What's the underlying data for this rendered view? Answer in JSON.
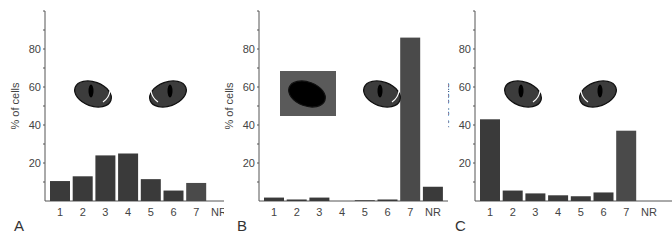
{
  "figure": {
    "panels": [
      {
        "letter": "A",
        "ylabel": "% of cells",
        "stimulus": "both-eyes-open"
      },
      {
        "letter": "B",
        "ylabel": "% of cells",
        "stimulus": "left-eye-occluded"
      },
      {
        "letter": "C",
        "ylabel": "% of cells",
        "stimulus": "both-eyes-open"
      }
    ],
    "yticks": [
      "20",
      "40",
      "60",
      "80"
    ],
    "categories": [
      "1",
      "2",
      "3",
      "4",
      "5",
      "6",
      "7",
      "NR"
    ]
  },
  "chart_data": [
    {
      "type": "bar",
      "panel": "A",
      "title": "",
      "xlabel": "",
      "ylabel": "% of cells",
      "categories": [
        "1",
        "2",
        "3",
        "4",
        "5",
        "6",
        "7",
        "NR"
      ],
      "values": [
        10.5,
        13,
        24,
        25,
        11.5,
        5.5,
        9.5,
        0
      ],
      "ylim": [
        0,
        100
      ],
      "yticks": [
        20,
        40,
        60,
        80
      ],
      "grid": false,
      "legend": "none",
      "annotations": [
        "two open cat eyes pictogram"
      ]
    },
    {
      "type": "bar",
      "panel": "B",
      "title": "",
      "xlabel": "",
      "ylabel": "% of cells",
      "categories": [
        "1",
        "2",
        "3",
        "4",
        "5",
        "6",
        "7",
        "NR"
      ],
      "values": [
        1.8,
        0.8,
        1.8,
        0,
        0.4,
        0.8,
        86,
        7.5
      ],
      "ylim": [
        0,
        100
      ],
      "yticks": [
        20,
        40,
        60,
        80
      ],
      "grid": false,
      "legend": "none",
      "annotations": [
        "left eye occluded (gray square patch), right eye open"
      ]
    },
    {
      "type": "bar",
      "panel": "C",
      "title": "",
      "xlabel": "",
      "ylabel": "% of cells",
      "categories": [
        "1",
        "2",
        "3",
        "4",
        "5",
        "6",
        "7",
        "NR"
      ],
      "values": [
        43,
        5.5,
        4,
        3,
        2.5,
        4.5,
        37,
        0
      ],
      "ylim": [
        0,
        100
      ],
      "yticks": [
        20,
        40,
        60,
        80
      ],
      "grid": false,
      "legend": "none",
      "annotations": [
        "two open cat eyes pictogram"
      ]
    }
  ],
  "colors": {
    "bar": "#3a3a3a",
    "bar_light": "#4a4a4a",
    "axis": "#555555",
    "occluder": "#5a5a5a",
    "eye_fill": "#3c3c3c",
    "pupil": "#000000"
  }
}
